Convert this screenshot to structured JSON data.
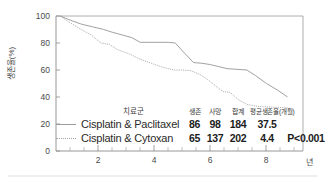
{
  "chart_data": {
    "type": "line",
    "title": "",
    "xlabel": "뎐",
    "ylabel": "생존율(%)",
    "xlim": [
      0,
      8.8
    ],
    "ylim": [
      0,
      100
    ],
    "x_ticks": [
      "2",
      "4",
      "6",
      "8"
    ],
    "x_tick_values": [
      2,
      4,
      6,
      8
    ],
    "y_ticks": [
      "0",
      "20",
      "40",
      "60",
      "80",
      "100"
    ],
    "y_tick_values": [
      0,
      20,
      40,
      60,
      80,
      100
    ],
    "x_unit": "년",
    "grid": false,
    "legend_position": "inside-bottom",
    "series": [
      {
        "name": "Cisplatin & Paclitaxel",
        "style": "solid",
        "color": "#9c9c9c",
        "x": [
          0.15,
          0.5,
          0.9,
          1.3,
          1.7,
          2.0,
          2.35,
          2.7,
          3.0,
          3.5,
          4.0,
          4.25,
          4.6,
          4.9,
          5.2,
          5.5,
          5.8,
          6.1,
          6.45,
          6.8,
          7.1,
          7.5,
          7.9,
          8.25
        ],
        "y": [
          100,
          97,
          94,
          92,
          90,
          88,
          86,
          84,
          80.5,
          80.5,
          80.5,
          80,
          72,
          65.5,
          65,
          64,
          62.5,
          61,
          60.5,
          60,
          56,
          50,
          45,
          40
        ]
      },
      {
        "name": "Cisplatin & Cytoxan",
        "style": "dotted",
        "color": "#a5a5a5",
        "x": [
          0.15,
          0.5,
          0.9,
          1.25,
          1.6,
          1.9,
          2.2,
          2.6,
          3.0,
          3.4,
          3.8,
          4.2,
          4.5,
          4.8,
          5.1,
          5.4,
          5.7,
          5.95,
          6.2,
          6.5,
          6.8,
          7.2,
          7.7,
          8.25
        ],
        "y": [
          100,
          95,
          90,
          86,
          80,
          79,
          75,
          72,
          68,
          65,
          62,
          60,
          60,
          59.5,
          57,
          53,
          48,
          44,
          43.5,
          38,
          34.5,
          33,
          32.5,
          32
        ]
      }
    ],
    "stats_table": {
      "group_header": "치료군",
      "columns": [
        "생존",
        "사망",
        "합계",
        "평균생존율(개월)",
        ""
      ],
      "rows": [
        {
          "series": "Cisplatin & Paclitaxel",
          "line_style": "solid",
          "alive": "86",
          "dead": "98",
          "total": "184",
          "mean_survival": "37.5",
          "p_value": ""
        },
        {
          "series": "Cisplatin & Cytoxan",
          "line_style": "dotted",
          "alive": "65",
          "dead": "137",
          "total": "202",
          "mean_survival": "4.4",
          "p_value": "P<0.001"
        }
      ]
    }
  }
}
